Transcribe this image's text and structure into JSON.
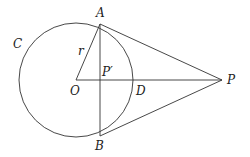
{
  "diagram": {
    "labels": {
      "A": "A",
      "B": "B",
      "C": "C",
      "O": "O",
      "P": "P",
      "P_prime": "P′",
      "D": "D",
      "r": "r"
    },
    "geometry": {
      "circle": {
        "cx": 76,
        "cy": 80,
        "r": 57
      },
      "points": {
        "O": [
          76,
          80
        ],
        "A": [
          100,
          24
        ],
        "B": [
          100,
          136
        ],
        "P": [
          222,
          80
        ],
        "P_prime": [
          100,
          80
        ],
        "D": [
          133,
          80
        ]
      },
      "segments": [
        "OA",
        "OP",
        "AB",
        "AP",
        "BP"
      ]
    },
    "colors": {
      "stroke": "#333333",
      "text": "#222222"
    }
  }
}
